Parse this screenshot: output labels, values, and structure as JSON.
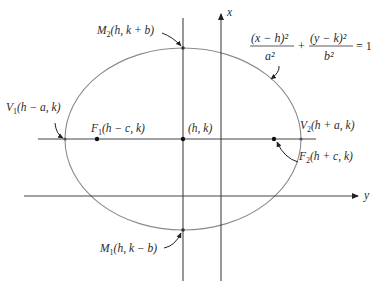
{
  "diagram": {
    "type": "ellipse-with-shifted-axes",
    "axes": {
      "vertical_axis_label": "x",
      "horizontal_axis_label": "y"
    },
    "center": {
      "label": "(h, k)"
    },
    "equation": {
      "term1_numerator": "(x − h)²",
      "term1_denominator": "a²",
      "plus": "+",
      "term2_numerator": "(y − k)²",
      "term2_denominator": "b²",
      "rhs": "= 1"
    },
    "points": {
      "M2": {
        "name": "M",
        "sub": "2",
        "coords": "(h, k + b)"
      },
      "M1": {
        "name": "M",
        "sub": "1",
        "coords": "(h, k − b)"
      },
      "V1": {
        "name": "V",
        "sub": "1",
        "coords": "(h − a, k)"
      },
      "V2": {
        "name": "V",
        "sub": "2",
        "coords": "(h + a, k)"
      },
      "F1": {
        "name": "F",
        "sub": "1",
        "coords": "(h − c, k)"
      },
      "F2": {
        "name": "F",
        "sub": "2",
        "coords": "(h + c, k)"
      }
    },
    "colors": {
      "ellipse": "#8a8a8a",
      "lines": "#333333",
      "text": "#2a2a2a"
    }
  }
}
